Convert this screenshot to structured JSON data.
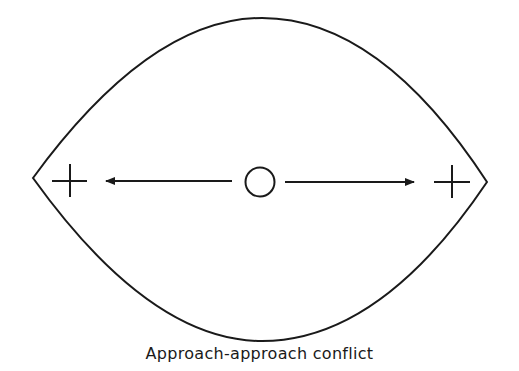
{
  "diagram": {
    "caption": "Approach-approach conflict",
    "center_symbol": "O",
    "left_goal_symbol": "+",
    "right_goal_symbol": "+",
    "arrows": [
      {
        "from": "center",
        "to": "left-goal",
        "direction": "left"
      },
      {
        "from": "center",
        "to": "right-goal",
        "direction": "right"
      }
    ],
    "stroke_color": "#1a1a1a",
    "background": "#ffffff"
  }
}
